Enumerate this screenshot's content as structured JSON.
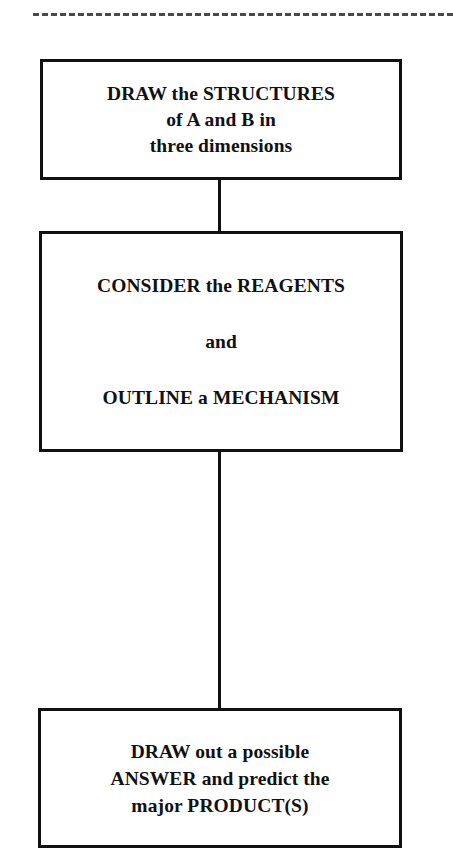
{
  "page": {
    "background_color": "#ffffff",
    "ink_color": "#111111",
    "dashed_rule_color": "#4a4a4a"
  },
  "separator": {
    "name": "dashed-rule",
    "style": "dashed"
  },
  "flowchart": {
    "title": "Problem solving strategy flowchart",
    "nodes": [
      {
        "id": "structures",
        "shape": "rectangle",
        "lines": [
          "DRAW the STRUCTURES",
          "of A and B in",
          "three dimensions"
        ]
      },
      {
        "id": "mechanism",
        "shape": "rectangle",
        "lines": [
          "CONSIDER the REAGENTS",
          "and",
          "OUTLINE a MECHANISM"
        ]
      },
      {
        "id": "answer",
        "shape": "rectangle",
        "lines": [
          "DRAW out a possible",
          "ANSWER and predict the",
          "major PRODUCT(S)"
        ]
      }
    ],
    "connectors": [
      {
        "id": "structures-to-mechanism",
        "from": "structures",
        "to": "mechanism",
        "style": "solid-vertical"
      },
      {
        "id": "mechanism-to-answer",
        "from": "mechanism",
        "to": "answer",
        "style": "solid-vertical"
      }
    ]
  }
}
